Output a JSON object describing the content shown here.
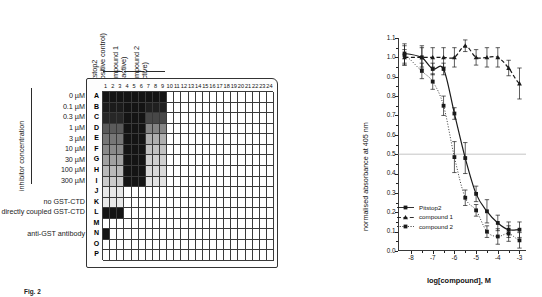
{
  "figure": {
    "caption_label": "Fig. 2",
    "caption_text": "Fig. 2"
  },
  "plate": {
    "axis_label": "inhibitor concentration",
    "group_headers": [
      {
        "name": "pitstop2-header",
        "line1": "Pitstop2",
        "line2": "(positive control)",
        "columns": [
          1,
          2,
          3
        ]
      },
      {
        "name": "compound1-header",
        "line1": "compound 1",
        "line2": "(inactive)",
        "columns": [
          4,
          5,
          6
        ]
      },
      {
        "name": "compound2-header",
        "line1": "compound 2",
        "line2": "(active)",
        "columns": [
          7,
          8,
          9
        ]
      }
    ],
    "column_numbers": [
      1,
      2,
      3,
      4,
      5,
      6,
      7,
      8,
      9,
      10,
      11,
      12,
      13,
      14,
      15,
      16,
      17,
      18,
      19,
      20,
      21,
      22,
      23,
      24
    ],
    "row_letters": [
      "A",
      "B",
      "C",
      "D",
      "E",
      "F",
      "G",
      "H",
      "I",
      "J",
      "K",
      "L",
      "M",
      "N",
      "O",
      "P"
    ],
    "row_labels": [
      {
        "row": "A",
        "label": "0 µM"
      },
      {
        "row": "B",
        "label": "0.1 µM"
      },
      {
        "row": "C",
        "label": "0.3 µM"
      },
      {
        "row": "D",
        "label": "1 µM"
      },
      {
        "row": "E",
        "label": "3 µM"
      },
      {
        "row": "F",
        "label": "10 µM"
      },
      {
        "row": "G",
        "label": "30 µM"
      },
      {
        "row": "H",
        "label": "100 µM"
      },
      {
        "row": "I",
        "label": "300 µM"
      },
      {
        "row": "J",
        "label": ""
      },
      {
        "row": "K",
        "label": "no GST-CTD"
      },
      {
        "row": "L",
        "label": "directly coupled GST-CTD"
      },
      {
        "row": "M",
        "label": ""
      },
      {
        "row": "N",
        "label": "anti-GST antibody"
      },
      {
        "row": "O",
        "label": ""
      },
      {
        "row": "P",
        "label": ""
      }
    ],
    "well_intensity_legend": {
      "description": "0 = white (no signal), 1 = black (full signal)",
      "min": 0,
      "max": 1
    },
    "well_intensities": {
      "A": [
        1.0,
        1.0,
        1.0,
        1.0,
        1.0,
        1.0,
        1.0,
        1.0,
        1.0,
        0,
        0,
        0,
        0,
        0,
        0,
        0,
        0,
        0,
        0,
        0,
        0,
        0,
        0,
        0
      ],
      "B": [
        0.97,
        0.97,
        0.97,
        1.0,
        1.0,
        1.0,
        0.95,
        0.95,
        0.95,
        0,
        0,
        0,
        0,
        0,
        0,
        0,
        0,
        0,
        0,
        0,
        0,
        0,
        0,
        0
      ],
      "C": [
        0.92,
        0.92,
        0.92,
        1.0,
        1.0,
        1.0,
        0.78,
        0.78,
        0.78,
        0,
        0,
        0,
        0,
        0,
        0,
        0,
        0,
        0,
        0,
        0,
        0,
        0,
        0,
        0
      ],
      "D": [
        0.7,
        0.7,
        0.7,
        1.0,
        1.0,
        1.0,
        0.52,
        0.52,
        0.52,
        0,
        0,
        0,
        0,
        0,
        0,
        0,
        0,
        0,
        0,
        0,
        0,
        0,
        0,
        0
      ],
      "E": [
        0.58,
        0.58,
        0.58,
        1.0,
        1.0,
        1.0,
        0.34,
        0.34,
        0.34,
        0,
        0,
        0,
        0,
        0,
        0,
        0,
        0,
        0,
        0,
        0,
        0,
        0,
        0,
        0
      ],
      "F": [
        0.5,
        0.5,
        0.5,
        1.0,
        1.0,
        1.0,
        0.26,
        0.26,
        0.26,
        0,
        0,
        0,
        0,
        0,
        0,
        0,
        0,
        0,
        0,
        0,
        0,
        0,
        0,
        0
      ],
      "G": [
        0.4,
        0.4,
        0.4,
        1.0,
        1.0,
        1.0,
        0.2,
        0.2,
        0.2,
        0,
        0,
        0,
        0,
        0,
        0,
        0,
        0,
        0,
        0,
        0,
        0,
        0,
        0,
        0
      ],
      "H": [
        0.3,
        0.3,
        0.3,
        1.0,
        1.0,
        1.0,
        0.16,
        0.16,
        0.16,
        0,
        0,
        0,
        0,
        0,
        0,
        0,
        0,
        0,
        0,
        0,
        0,
        0,
        0,
        0
      ],
      "I": [
        0.22,
        0.22,
        0.22,
        1.0,
        1.0,
        1.0,
        0.12,
        0.12,
        0.12,
        0,
        0,
        0,
        0,
        0,
        0,
        0,
        0,
        0,
        0,
        0,
        0,
        0,
        0,
        0
      ],
      "J": [
        0.1,
        0.1,
        0.1,
        0,
        0,
        0,
        0,
        0,
        0,
        0,
        0,
        0,
        0,
        0,
        0,
        0,
        0,
        0,
        0,
        0,
        0,
        0,
        0,
        0
      ],
      "K": [
        0.1,
        0.1,
        0.1,
        0,
        0,
        0,
        0,
        0,
        0,
        0,
        0,
        0,
        0,
        0,
        0,
        0,
        0,
        0,
        0,
        0,
        0,
        0,
        0,
        0
      ],
      "L": [
        1.0,
        1.0,
        1.0,
        0,
        0,
        0,
        0,
        0,
        0,
        0,
        0,
        0,
        0,
        0,
        0,
        0,
        0,
        0,
        0,
        0,
        0,
        0,
        0,
        0
      ],
      "M": [
        0,
        0,
        0,
        0,
        0,
        0,
        0,
        0,
        0,
        0,
        0,
        0,
        0,
        0,
        0,
        0,
        0,
        0,
        0,
        0,
        0,
        0,
        0,
        0
      ],
      "N": [
        1.0,
        0,
        0,
        0,
        0,
        0,
        0,
        0,
        0,
        0,
        0,
        0,
        0,
        0,
        0,
        0,
        0,
        0,
        0,
        0,
        0,
        0,
        0,
        0
      ],
      "O": [
        0,
        0,
        0,
        0,
        0,
        0,
        0,
        0,
        0,
        0,
        0,
        0,
        0,
        0,
        0,
        0,
        0,
        0,
        0,
        0,
        0,
        0,
        0,
        0
      ],
      "P": [
        0,
        0,
        0,
        0,
        0,
        0,
        0,
        0,
        0,
        0,
        0,
        0,
        0,
        0,
        0,
        0,
        0,
        0,
        0,
        0,
        0,
        0,
        0,
        0
      ]
    }
  },
  "chart_data": {
    "type": "line",
    "title": "",
    "xlabel": "log[compound], M",
    "ylabel": "normalised absorbance at 405 nm",
    "xlim": [
      -8.6,
      -2.7
    ],
    "ylim": [
      0.0,
      1.1
    ],
    "xticks": [
      -8,
      -7,
      -6,
      -5,
      -4,
      -3
    ],
    "xticklabels": [
      "-8",
      "-7",
      "-6",
      "-5",
      "-4",
      "-3"
    ],
    "yticks": [
      0.0,
      0.1,
      0.2,
      0.3,
      0.4,
      0.5,
      0.6,
      0.7,
      0.8,
      0.9,
      1.0,
      1.1
    ],
    "yticklabels": [
      "0.0",
      "0.1",
      "0.2",
      "0.3",
      "0.4",
      "0.5",
      "0.6",
      "0.7",
      "0.8",
      "0.9",
      "1.0",
      "1.1"
    ],
    "grid": false,
    "reference_line": {
      "name": "ic50-reference-line",
      "y": 0.5,
      "style": "solid-thin"
    },
    "legend_position": "lower-left",
    "series": [
      {
        "name": "Pitstop2",
        "marker": "square",
        "line_style": "solid",
        "color": "#1a1a1a",
        "x": [
          -8.3,
          -7.5,
          -7.0,
          -6.5,
          -6.0,
          -5.5,
          -5.0,
          -4.5,
          -4.0,
          -3.5,
          -3.0
        ],
        "y": [
          1.02,
          1.0,
          0.94,
          0.94,
          0.71,
          0.48,
          0.295,
          0.205,
          0.145,
          0.11,
          0.11
        ],
        "yerr": [
          0.05,
          0.05,
          0.03,
          0.03,
          0.03,
          0.08,
          0.04,
          0.06,
          0.04,
          0.04,
          0.04
        ]
      },
      {
        "name": "compound 1",
        "marker": "triangle",
        "line_style": "dashed",
        "color": "#1a1a1a",
        "x": [
          -8.3,
          -7.5,
          -7.0,
          -6.5,
          -6.0,
          -5.5,
          -5.0,
          -4.5,
          -4.0,
          -3.5,
          -3.0
        ],
        "y": [
          1.0,
          1.0,
          1.0,
          1.0,
          1.0,
          1.06,
          1.0,
          1.0,
          1.0,
          0.945,
          0.865
        ],
        "yerr": [
          0.04,
          0.06,
          0.05,
          0.05,
          0.05,
          0.03,
          0.04,
          0.05,
          0.05,
          0.04,
          0.08
        ]
      },
      {
        "name": "compound 2",
        "marker": "square",
        "line_style": "dotted",
        "color": "#1a1a1a",
        "x": [
          -8.3,
          -7.5,
          -7.0,
          -6.5,
          -6.0,
          -5.5,
          -5.0,
          -4.5,
          -4.0,
          -3.5,
          -3.0
        ],
        "y": [
          1.01,
          0.93,
          0.875,
          0.75,
          0.485,
          0.275,
          0.21,
          0.1,
          0.075,
          0.09,
          0.055
        ],
        "yerr": [
          0.05,
          0.04,
          0.04,
          0.05,
          0.08,
          0.04,
          0.03,
          0.03,
          0.04,
          0.04,
          0.04
        ]
      }
    ]
  }
}
